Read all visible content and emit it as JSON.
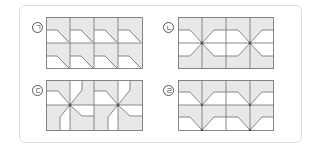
{
  "figure": {
    "panels": [
      {
        "id": "a",
        "label": "ㄱ",
        "description": "4x2 tiles, each with a diagonal step line from left-middle to bottom-right"
      },
      {
        "id": "b",
        "label": "ㄴ",
        "description": "4x4 grid with two X-shaped motifs joined by hexagonal bands"
      },
      {
        "id": "c",
        "label": "ㄷ",
        "description": "4x2 grid with two pinwheel motifs centered at star points"
      },
      {
        "id": "d",
        "label": "ㄹ",
        "description": "4x2 grid with V-shaped funnel motifs pointing down"
      }
    ],
    "colors": {
      "fill": "#e8e8e8",
      "line": "#7a7a7a",
      "border": "#dcdcdc",
      "dot": "#555555"
    }
  }
}
